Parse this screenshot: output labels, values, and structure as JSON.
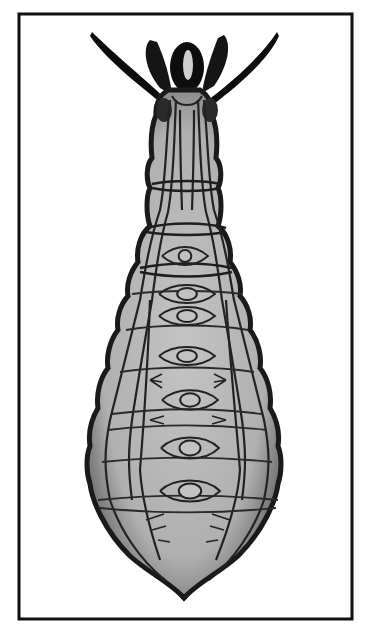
{
  "figure": {
    "colors": {
      "background": "#ffffff",
      "frame": "#111111",
      "body_fill": "#b9b9b9",
      "body_outline": "#1a1a1a",
      "lines": "#222222",
      "appendages": "#0d0d0d"
    },
    "frame": {
      "x": 19,
      "y": 14,
      "width": 333,
      "height": 605,
      "stroke_width": 3
    },
    "ganglia": [
      {
        "cx": 185,
        "cy": 256,
        "rx": 9,
        "ry": 8
      },
      {
        "cx": 187,
        "cy": 294,
        "rx": 14,
        "ry": 8
      },
      {
        "cx": 187,
        "cy": 316,
        "rx": 14,
        "ry": 8
      },
      {
        "cx": 187,
        "cy": 356,
        "rx": 14,
        "ry": 8
      },
      {
        "cx": 190,
        "cy": 400,
        "rx": 14,
        "ry": 9
      },
      {
        "cx": 190,
        "cy": 448,
        "rx": 15,
        "ry": 10
      },
      {
        "cx": 190,
        "cy": 491,
        "rx": 16,
        "ry": 10
      }
    ]
  }
}
